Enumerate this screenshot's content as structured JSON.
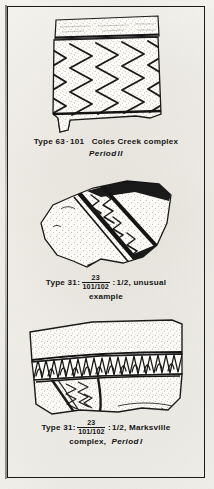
{
  "plate": {
    "paper_color": "#fbfaf6",
    "ink_color": "#161616",
    "frame_color": "#1b1b1b"
  },
  "figures": [
    {
      "id": "figure-1",
      "artifact": {
        "name": "rim-sherd-zigzag-incised",
        "description": "Pottery rim sherd with plain rim band above a zone of bold incised zigzag (chevron) lines on a stippled body",
        "motif": "zigzag-incised"
      },
      "caption": {
        "type_label": "Type",
        "type_number": "63",
        "separator": "·",
        "type_number_2": "101",
        "complex": "Coles Creek complex",
        "period": "Period",
        "period_numeral": "II"
      }
    },
    {
      "id": "figure-2",
      "artifact": {
        "name": "body-sherd-banded-zigzag",
        "description": "Irregular body sherd with a diagonal decorated band bordered by heavy dark incised lines, filled with nested zigzag elements, on a stippled ground",
        "motif": "banded-zigzag"
      },
      "caption": {
        "type_label": "Type",
        "type_number": "31",
        "colon": ":",
        "fraction_numerator": "23",
        "fraction_denominator": "101/102",
        "ratio": "1/2",
        "note_line_1": ", unusual",
        "note_line_2": "example"
      }
    },
    {
      "id": "figure-3",
      "artifact": {
        "name": "rim-sherd-hatched-band",
        "description": "Wide rim sherd with plain stippled rim above a horizontal band of dense zigzag hatching, with incised lines on the lower body",
        "motif": "hatched-zigzag-band"
      },
      "caption": {
        "type_label": "Type",
        "type_number": "31",
        "colon": ":",
        "fraction_numerator": "23",
        "fraction_denominator": "101/102",
        "ratio": "1/2",
        "complex_line_1": ", Marksville",
        "complex_line_2": "complex,",
        "period": "Period",
        "period_numeral": "I"
      }
    }
  ]
}
